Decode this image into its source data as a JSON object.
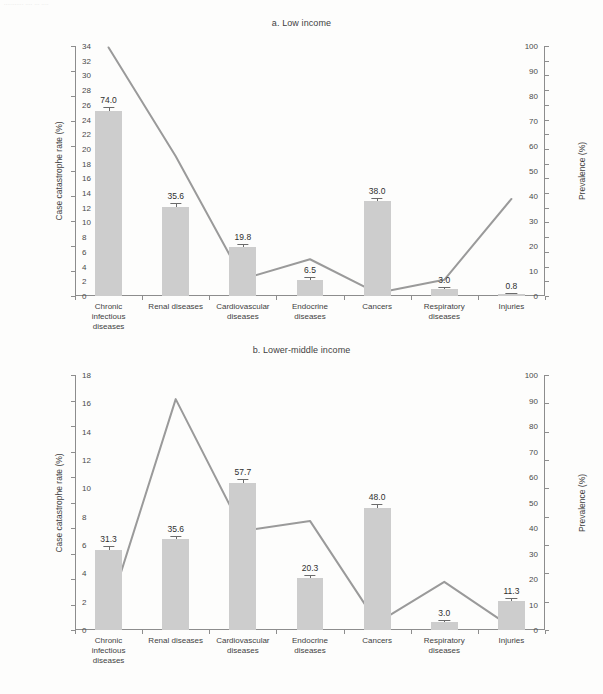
{
  "top_fragment": "........... .... ... ....",
  "chart_data": [
    {
      "id": "a",
      "type": "bar",
      "title": "a. Low income",
      "xlabel": "",
      "ylabel": "Case catastrophe rate (%)",
      "y2label": "Prevalence (%)",
      "ylim": [
        0,
        100
      ],
      "yticks": [
        0,
        10,
        20,
        30,
        40,
        50,
        60,
        70,
        80,
        90,
        100
      ],
      "y2lim": [
        0,
        34
      ],
      "y2ticks": [
        0,
        2,
        4,
        6,
        8,
        10,
        12,
        14,
        16,
        18,
        20,
        22,
        24,
        26,
        28,
        30,
        32,
        34
      ],
      "grid": false,
      "legend": "none",
      "categories": [
        "Chronic\ninfectious\ndiseases",
        "Renal diseases",
        "Cardiovascular\ndiseases",
        "Endocrine\ndiseases",
        "Cancers",
        "Respiratory\ndiseases",
        "Injuries"
      ],
      "series": [
        {
          "name": "Case catastrophe rate (%)",
          "kind": "bar",
          "axis": "left",
          "values": [
            74.0,
            35.6,
            19.8,
            6.5,
            38.0,
            3.0,
            0.8
          ],
          "labels": [
            "74.0",
            "35.6",
            "19.8",
            "6.5",
            "38.0",
            "3.0",
            "0.8"
          ],
          "errors": [
            1.6,
            1.5,
            1.2,
            1.0,
            1.2,
            0.8,
            0.4
          ],
          "color": "#cdcdcd"
        },
        {
          "name": "Prevalence (%)",
          "kind": "line",
          "axis": "right",
          "values": [
            33.8,
            19.0,
            2.3,
            5.0,
            0.4,
            2.2,
            13.2
          ],
          "color": "#9a9a9a"
        }
      ]
    },
    {
      "id": "b",
      "type": "bar",
      "title": "b. Lower-middle income",
      "xlabel": "",
      "ylabel": "Case catastrophe rate (%)",
      "y2label": "Prevalence (%)",
      "ylim": [
        0,
        100
      ],
      "yticks": [
        0,
        10,
        20,
        30,
        40,
        50,
        60,
        70,
        80,
        90,
        100
      ],
      "y2lim": [
        0,
        18
      ],
      "y2ticks": [
        0,
        2,
        4,
        6,
        8,
        10,
        12,
        14,
        16,
        18
      ],
      "grid": false,
      "legend": "none",
      "categories": [
        "Chronic\ninfectious\ndiseases",
        "Renal diseases",
        "Cardiovascular\ndiseases",
        "Endocrine\ndiseases",
        "Cancers",
        "Respiratory\ndiseases",
        "Injuries"
      ],
      "series": [
        {
          "name": "Case catastrophe rate (%)",
          "kind": "bar",
          "axis": "left",
          "values": [
            31.3,
            35.6,
            57.7,
            20.3,
            48.0,
            3.0,
            11.3
          ],
          "labels": [
            "31.3",
            "35.6",
            "57.7",
            "20.3",
            "48.0",
            "3.0",
            "11.3"
          ],
          "errors": [
            1.5,
            1.4,
            1.5,
            1.3,
            1.3,
            0.9,
            1.1
          ],
          "color": "#cdcdcd"
        },
        {
          "name": "Prevalence (%)",
          "kind": "line",
          "axis": "right",
          "values": [
            1.3,
            16.3,
            7.0,
            7.7,
            0.5,
            3.4,
            0.2
          ],
          "color": "#9a9a9a"
        }
      ]
    }
  ]
}
